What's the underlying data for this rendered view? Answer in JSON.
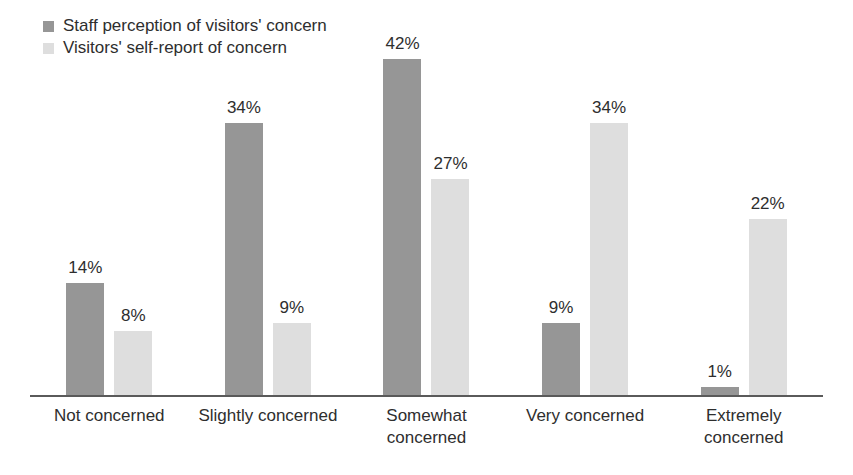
{
  "figure": {
    "background": "#ffffff",
    "axis_color": "#5a5a5a",
    "text_color": "#2e2e2e"
  },
  "legend": {
    "position": "top-left",
    "items": [
      {
        "label": "Staff perception of visitors' concern",
        "color": "#969696"
      },
      {
        "label": "Visitors' self-report of concern",
        "color": "#dedede"
      }
    ]
  },
  "chart_data": {
    "type": "bar",
    "categories": [
      "Not concerned",
      "Slightly concerned",
      "Somewhat concerned",
      "Very concerned",
      "Extremely concerned"
    ],
    "categories_display": [
      [
        "Not concerned"
      ],
      [
        "Slightly concerned"
      ],
      [
        "Somewhat",
        "concerned"
      ],
      [
        "Very concerned"
      ],
      [
        "Extremely",
        "concerned"
      ]
    ],
    "series": [
      {
        "name": "Staff perception of visitors' concern",
        "color": "#969696",
        "values": [
          14,
          34,
          42,
          9,
          1
        ]
      },
      {
        "name": "Visitors' self-report of concern",
        "color": "#dedede",
        "values": [
          8,
          9,
          27,
          34,
          22
        ]
      }
    ],
    "value_suffix": "%",
    "data_labels": true,
    "title": "",
    "xlabel": "",
    "ylabel": "",
    "ylim": [
      0,
      45
    ],
    "grid": false,
    "legend_position": "top-left"
  }
}
